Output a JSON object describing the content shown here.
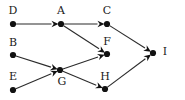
{
  "diagram": {
    "type": "directed-acyclic-graph",
    "background_color": "#ffffff",
    "node_color": "#111111",
    "edge_color": "#2b2b2b",
    "label_color": "#1a1a1a",
    "nodes": [
      {
        "id": "D",
        "label": "D",
        "x": 13,
        "y": 24,
        "label_x": 13,
        "label_y": 11
      },
      {
        "id": "A",
        "label": "A",
        "x": 61,
        "y": 24,
        "label_x": 61,
        "label_y": 11
      },
      {
        "id": "C",
        "label": "C",
        "x": 107,
        "y": 24,
        "label_x": 107,
        "label_y": 11
      },
      {
        "id": "B",
        "label": "B",
        "x": 13,
        "y": 55,
        "label_x": 13,
        "label_y": 43
      },
      {
        "id": "F",
        "label": "F",
        "x": 107,
        "y": 54,
        "label_x": 107,
        "label_y": 42
      },
      {
        "id": "I",
        "label": "I",
        "x": 153,
        "y": 53,
        "label_x": 165,
        "label_y": 52
      },
      {
        "id": "E",
        "label": "E",
        "x": 13,
        "y": 90,
        "label_x": 13,
        "label_y": 77
      },
      {
        "id": "G",
        "label": "G",
        "x": 60,
        "y": 70,
        "label_x": 62,
        "label_y": 82
      },
      {
        "id": "H",
        "label": "H",
        "x": 105,
        "y": 89,
        "label_x": 105,
        "label_y": 77
      }
    ],
    "edges": [
      {
        "from": "D",
        "to": "A",
        "directed": true
      },
      {
        "from": "A",
        "to": "C",
        "directed": true
      },
      {
        "from": "A",
        "to": "F",
        "directed": true
      },
      {
        "from": "B",
        "to": "G",
        "directed": true
      },
      {
        "from": "E",
        "to": "G",
        "directed": true
      },
      {
        "from": "G",
        "to": "F",
        "directed": true
      },
      {
        "from": "G",
        "to": "H",
        "directed": true
      },
      {
        "from": "C",
        "to": "I",
        "directed": true
      },
      {
        "from": "H",
        "to": "I",
        "directed": true
      }
    ]
  }
}
